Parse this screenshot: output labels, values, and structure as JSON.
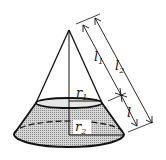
{
  "diagram": {
    "type": "truncated-cone (frustum) geometry figure",
    "labels": {
      "r1": {
        "base": "r",
        "sub": "1"
      },
      "r2": {
        "base": "r",
        "sub": "2"
      },
      "l1": {
        "base": "l",
        "sub": "1"
      },
      "l2": {
        "base": "l",
        "sub": "2"
      },
      "l": {
        "base": "l",
        "sub": ""
      }
    },
    "colors": {
      "stroke": "#111111",
      "shade": "#b8b8b8",
      "background": "#ffffff"
    }
  }
}
